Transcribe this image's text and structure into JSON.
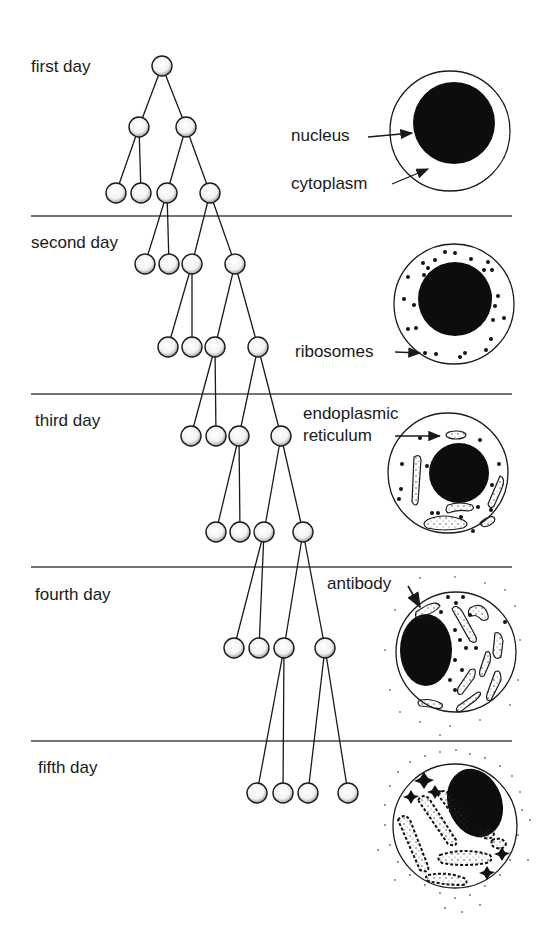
{
  "diagram": {
    "colors": {
      "ink": "#1a1a1a",
      "background": "#ffffff",
      "divider": "#444444"
    },
    "days": [
      {
        "label": "first day"
      },
      {
        "label": "second day"
      },
      {
        "label": "third day"
      },
      {
        "label": "fourth day"
      },
      {
        "label": "fifth day"
      }
    ],
    "cell_labels": {
      "nucleus": "nucleus",
      "cytoplasm": "cytoplasm",
      "ribosomes": "ribosomes",
      "endoplasmic_reticulum_line1": "endoplasmic",
      "endoplasmic_reticulum_line2": "reticulum",
      "antibody": "antibody"
    },
    "tree": {
      "description": "binary division tree, one generation per half-day",
      "generations": [
        1,
        2,
        4,
        4,
        4,
        4,
        4,
        4,
        4
      ]
    }
  }
}
